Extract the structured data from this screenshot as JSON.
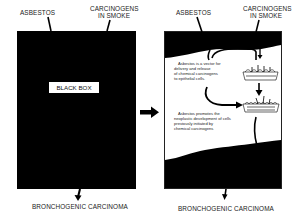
{
  "left_panel": {
    "top_labels": {
      "asbestos": "ASBESTOS",
      "carcinogens_line1": "CARCINOGENS",
      "carcinogens_line2": "IN SMOKE"
    },
    "center_label": "BLACK BOX",
    "bottom_label": "BRONCHOGENIC CARCINOMA"
  },
  "right_panel": {
    "top_labels": {
      "asbestos": "ASBESTOS",
      "carcinogens_line1": "CARCINOGENS",
      "carcinogens_line2": "IN SMOKE"
    },
    "description_1": [
      "Asbestos is a vector for",
      "delivery and release",
      "of chemical carcinogens",
      "to epithelial cells."
    ],
    "description_2": [
      "Asbestos promotes the",
      "neoplastic development of cells",
      "previously initiated by",
      "chemical carcinogens"
    ],
    "bottom_label": "BRONCHOGENIC CARCINOMA"
  },
  "colors": {
    "fill": "#000000",
    "background": "#ffffff"
  }
}
